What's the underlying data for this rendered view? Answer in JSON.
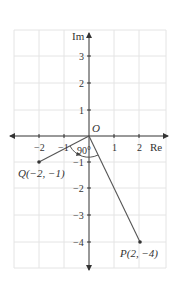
{
  "diagram": {
    "type": "complex-plane",
    "axes": {
      "x_label": "Re",
      "y_label": "Im",
      "origin_label": "O",
      "x_ticks": [
        {
          "value": -2,
          "label": "−2"
        },
        {
          "value": -1,
          "label": "−1"
        },
        {
          "value": 1,
          "label": "1"
        },
        {
          "value": 2,
          "label": "2"
        }
      ],
      "y_ticks": [
        {
          "value": 3,
          "label": "3"
        },
        {
          "value": 2,
          "label": "2"
        },
        {
          "value": 1,
          "label": "1"
        },
        {
          "value": -1,
          "label": "−1"
        },
        {
          "value": -2,
          "label": "−2"
        },
        {
          "value": -3,
          "label": "−3"
        },
        {
          "value": -4,
          "label": "−4"
        }
      ],
      "x_range": [
        -3,
        3
      ],
      "y_range": [
        -5,
        4
      ]
    },
    "points": [
      {
        "name": "Q",
        "x": -2,
        "y": -1,
        "label": "Q(−2, −1)"
      },
      {
        "name": "P",
        "x": 2,
        "y": -4,
        "label": "P(2, −4)"
      }
    ],
    "angle": {
      "label": "90°",
      "from": "Q",
      "to": "P",
      "direction": "counterclockwise"
    },
    "colors": {
      "grid": "#e4e4e4",
      "axis": "#333333",
      "segment": "#555555",
      "point": "#333333"
    }
  }
}
